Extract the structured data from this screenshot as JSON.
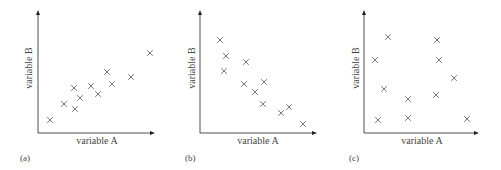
{
  "chart_data": [
    {
      "type": "scatter",
      "panel_label": "(a)",
      "xlabel": "variable A",
      "ylabel": "variable B",
      "xlim": [
        0,
        10
      ],
      "ylim": [
        0,
        10
      ],
      "grid": false,
      "ticks": false,
      "marker": "x",
      "description": "positive correlation",
      "points": [
        [
          1.03,
          1.06
        ],
        [
          2.22,
          2.36
        ],
        [
          3.08,
          3.66
        ],
        [
          3.16,
          1.95
        ],
        [
          3.59,
          2.85
        ],
        [
          4.53,
          3.82
        ],
        [
          5.13,
          3.17
        ],
        [
          5.9,
          4.96
        ],
        [
          6.32,
          3.98
        ],
        [
          7.95,
          4.55
        ],
        [
          9.57,
          6.5
        ]
      ]
    },
    {
      "type": "scatter",
      "panel_label": "(b)",
      "xlabel": "variable A",
      "ylabel": "variable B",
      "xlim": [
        0,
        10
      ],
      "ylim": [
        0,
        10
      ],
      "grid": false,
      "ticks": false,
      "marker": "x",
      "description": "negative correlation",
      "points": [
        [
          1.71,
          7.56
        ],
        [
          2.22,
          6.26
        ],
        [
          2.05,
          5.04
        ],
        [
          3.93,
          5.77
        ],
        [
          3.76,
          3.98
        ],
        [
          5.47,
          4.15
        ],
        [
          4.7,
          3.33
        ],
        [
          5.38,
          2.36
        ],
        [
          6.92,
          1.63
        ],
        [
          7.61,
          2.11
        ],
        [
          8.8,
          0.73
        ]
      ]
    },
    {
      "type": "scatter",
      "panel_label": "(c)",
      "xlabel": "variable A",
      "ylabel": "variable B",
      "xlim": [
        0,
        10
      ],
      "ylim": [
        0,
        10
      ],
      "grid": false,
      "ticks": false,
      "marker": "x",
      "description": "no correlation",
      "points": [
        [
          2.09,
          7.8
        ],
        [
          6.35,
          7.56
        ],
        [
          0.96,
          5.93
        ],
        [
          6.52,
          5.93
        ],
        [
          7.83,
          4.47
        ],
        [
          1.74,
          3.58
        ],
        [
          3.83,
          2.76
        ],
        [
          6.26,
          3.09
        ],
        [
          1.22,
          1.06
        ],
        [
          3.83,
          1.22
        ],
        [
          8.96,
          1.14
        ]
      ]
    }
  ],
  "colors": {
    "axis": "#222222",
    "marker": "#666666",
    "text": "#444444"
  },
  "panels": [
    {
      "tag": "(a)",
      "xlabel": "variable A",
      "ylabel": "variable B"
    },
    {
      "tag": "(b)",
      "xlabel": "variable A",
      "ylabel": "variable B"
    },
    {
      "tag": "(c)",
      "xlabel": "variable A",
      "ylabel": "variable B"
    }
  ]
}
